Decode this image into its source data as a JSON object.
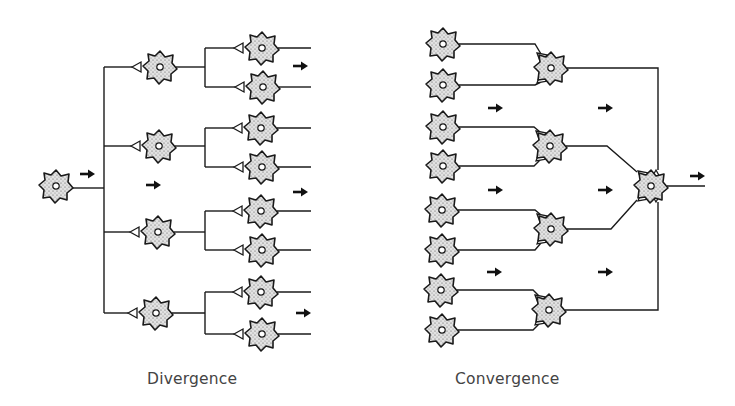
{
  "labels": {
    "divergence": "Divergence",
    "convergence": "Convergence"
  },
  "colors": {
    "line": "#1a1a1a",
    "cell_fill": "#d9d9d9",
    "label": "#444444",
    "background": "#ffffff"
  },
  "divergence": {
    "source_neuron": {
      "x": 56,
      "y": 186
    },
    "trunk_x": 104,
    "trunk_range": [
      67,
      313
    ],
    "level2_neurons": [
      {
        "x": 160,
        "y": 67
      },
      {
        "x": 159,
        "y": 146
      },
      {
        "x": 158,
        "y": 232
      },
      {
        "x": 156,
        "y": 313
      }
    ],
    "branch_x": 205,
    "level3_neurons": [
      {
        "x": 262,
        "y": 48
      },
      {
        "x": 263,
        "y": 87
      },
      {
        "x": 261,
        "y": 128
      },
      {
        "x": 262,
        "y": 167
      },
      {
        "x": 261,
        "y": 211
      },
      {
        "x": 262,
        "y": 250
      },
      {
        "x": 261,
        "y": 292
      },
      {
        "x": 262,
        "y": 334
      }
    ],
    "output_end_x": 311,
    "arrows": [
      {
        "x": 80,
        "y": 174
      },
      {
        "x": 146,
        "y": 185
      },
      {
        "x": 293,
        "y": 66
      },
      {
        "x": 293,
        "y": 192
      },
      {
        "x": 296,
        "y": 313
      }
    ]
  },
  "convergence": {
    "input_neurons": [
      {
        "x": 443,
        "y": 44
      },
      {
        "x": 443,
        "y": 85
      },
      {
        "x": 443,
        "y": 127
      },
      {
        "x": 443,
        "y": 166
      },
      {
        "x": 442,
        "y": 210
      },
      {
        "x": 442,
        "y": 250
      },
      {
        "x": 441,
        "y": 290
      },
      {
        "x": 442,
        "y": 330
      }
    ],
    "middle_neurons": [
      {
        "x": 551,
        "y": 68
      },
      {
        "x": 550,
        "y": 146
      },
      {
        "x": 551,
        "y": 229
      },
      {
        "x": 549,
        "y": 310
      }
    ],
    "final_neuron": {
      "x": 651,
      "y": 186
    },
    "output_end_x": 705,
    "arrows": [
      {
        "x": 488,
        "y": 108
      },
      {
        "x": 598,
        "y": 108
      },
      {
        "x": 488,
        "y": 190
      },
      {
        "x": 598,
        "y": 190
      },
      {
        "x": 487,
        "y": 272
      },
      {
        "x": 598,
        "y": 272
      },
      {
        "x": 690,
        "y": 176
      }
    ]
  }
}
